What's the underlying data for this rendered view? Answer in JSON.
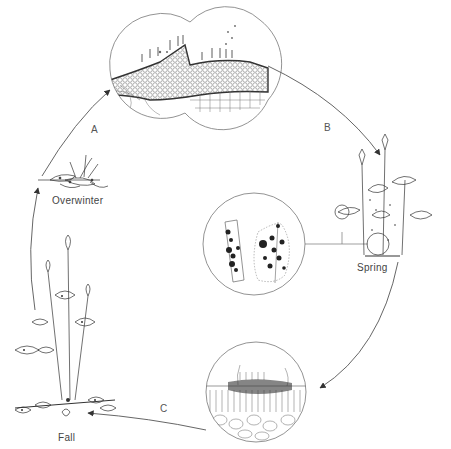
{
  "diagram": {
    "type": "disease-cycle",
    "stages": [
      {
        "id": "overwinter",
        "label": "Overwinter"
      },
      {
        "id": "spring",
        "label": "Spring"
      },
      {
        "id": "fall",
        "label": "Fall"
      }
    ],
    "transitions": [
      {
        "id": "A",
        "label": "A",
        "from": "overwinter",
        "to": "sporulation-detail"
      },
      {
        "id": "B",
        "label": "B",
        "from": "sporulation-detail",
        "to": "spring"
      },
      {
        "id": "C",
        "label": "C",
        "from": "leaf-cross-section",
        "to": "fall"
      }
    ],
    "insets": [
      {
        "id": "sporulation-detail",
        "description": "double-lobed magnified leaf section with fruiting bodies"
      },
      {
        "id": "leaf-spot-detail",
        "description": "magnified leaves showing dark lesion spots"
      },
      {
        "id": "leaf-cross-section",
        "description": "magnified leaf cross-section with infection on surface"
      }
    ],
    "colors": {
      "line": "#555555",
      "ink": "#333333",
      "background": "#ffffff"
    }
  }
}
